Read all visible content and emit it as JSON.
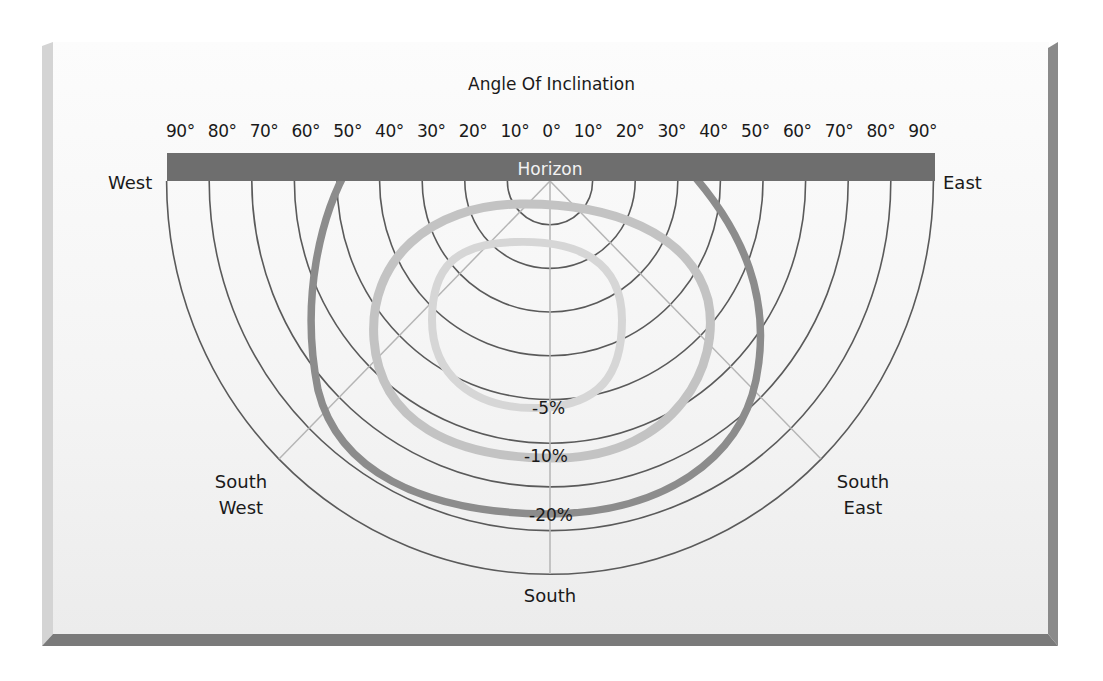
{
  "chart_data": {
    "type": "polar-diagram",
    "title": "Angle Of Inclination",
    "angle_ticks": [
      "90°",
      "80°",
      "70°",
      "60°",
      "50°",
      "40°",
      "30°",
      "20°",
      "10°",
      "0°",
      "10°",
      "20°",
      "30°",
      "40°",
      "50°",
      "60°",
      "70°",
      "80°",
      "90°"
    ],
    "horizon_label": "Horizon",
    "directions": {
      "west": "West",
      "east": "East",
      "south_west": [
        "South",
        "West"
      ],
      "south_east": [
        "South",
        "East"
      ],
      "south": "South"
    },
    "rings": 9,
    "ring_step_degrees": 10,
    "series": [
      {
        "name": "-5%",
        "label": "-5%",
        "color": "#d2d2d2",
        "description": "Closed loop centered slightly west of south, approx inclination 10°–50°"
      },
      {
        "name": "-10%",
        "label": "-10%",
        "color": "#c3c3c3",
        "description": "Loop reaching ~6° from horizon at top, extending ~55° at widest, ~65° at south"
      },
      {
        "name": "-20%",
        "label": "-20%",
        "color": "#8c8c8c",
        "description": "Outer curve meeting horizon at ~45° west and ~31° east, ~77° at south"
      }
    ]
  },
  "colors": {
    "horizon_bar": "#6e6e6e",
    "ring_line": "#5a5a5a",
    "radial_line": "#b5b5b5",
    "curve_5": "#d2d2d2",
    "curve_10": "#c3c3c3",
    "curve_20": "#8c8c8c"
  }
}
